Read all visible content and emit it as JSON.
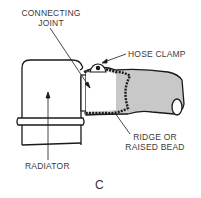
{
  "figure": {
    "letter": "C",
    "labels": {
      "connecting_joint_line1": "CONNECTING",
      "connecting_joint_line2": "JOINT",
      "hose_clamp": "HOSE CLAMP",
      "radiator": "RADIATOR",
      "ridge_line1": "RIDGE OR",
      "ridge_line2": "RAISED BEAD"
    }
  },
  "colors": {
    "line": "#1a1a1a",
    "hose_fill": "#c8c8c8",
    "text": "#3a3a3a"
  }
}
